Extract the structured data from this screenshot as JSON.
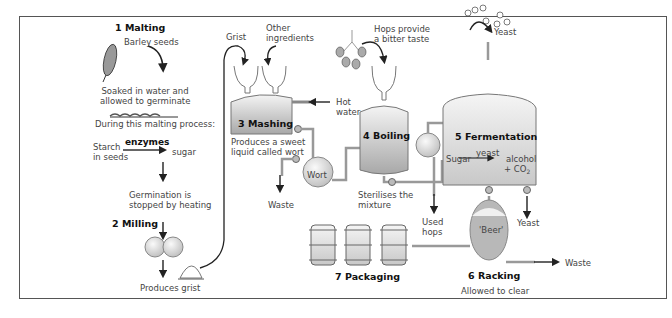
{
  "stages": [
    {
      "id": "malting",
      "label": "1  Malting"
    },
    {
      "id": "milling",
      "label": "2  Milling"
    },
    {
      "id": "mashing",
      "label": "3  Mashing"
    },
    {
      "id": "boiling",
      "label": "4  Boiling"
    },
    {
      "id": "fermentation",
      "label": "5  Fermentation"
    },
    {
      "id": "racking",
      "label": "6  Racking"
    },
    {
      "id": "packaging",
      "label": "7  Packaging"
    }
  ],
  "malting": {
    "barley": "Barley seeds",
    "soaked_1": "Soaked in water and",
    "soaked_2": "allowed to germinate",
    "process": "During this malting process:",
    "starch_1": "Starch",
    "starch_2": "in seeds",
    "enzymes": "enzymes",
    "sugar": "sugar",
    "germ_1": "Germination is",
    "germ_2": "stopped by heating"
  },
  "milling": {
    "grist": "Produces grist"
  },
  "mashing": {
    "grist": "Grist",
    "other_1": "Other",
    "other_2": "ingredients",
    "hot_1": "Hot",
    "hot_2": "water",
    "desc_1": "Produces a sweet",
    "desc_2": "liquid called wort",
    "wort": "Wort",
    "waste": "Waste"
  },
  "boiling": {
    "hops_1": "Hops provide",
    "hops_2": "a bitter taste",
    "steril_1": "Sterilises the",
    "steril_2": "mixture",
    "used_1": "Used",
    "used_2": "hops"
  },
  "fermentation": {
    "yeast_in": "Yeast",
    "catalyst": "yeast",
    "sugar": "Sugar",
    "alcohol": "alcohol",
    "co2": "+ CO",
    "co2_sub": "2",
    "yeast_out": "Yeast"
  },
  "racking": {
    "beer": "'Beer'",
    "waste": "Waste",
    "clear": "Allowed to clear"
  },
  "colors": {
    "border": "#555555",
    "vessel_top": "#f2f2f2",
    "vessel_bottom": "#a9a9a9",
    "pipe": "#888888",
    "arrow": "#222222"
  }
}
